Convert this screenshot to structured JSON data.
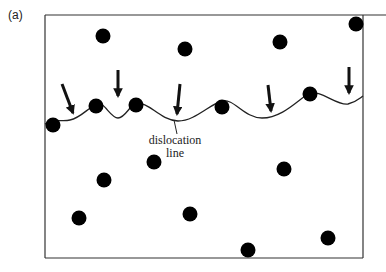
{
  "figure": {
    "panel_label": "(a)",
    "annotation": {
      "line1": "dislocation",
      "line2": "line"
    },
    "frame": {
      "x": 45,
      "y": 15,
      "width": 318,
      "height": 243,
      "top_edge_extends_to": 386
    },
    "colors": {
      "particle": "#000000",
      "line": "#222222",
      "frame": "#333333"
    },
    "particles": [
      {
        "x": 103,
        "y": 36
      },
      {
        "x": 185,
        "y": 49
      },
      {
        "x": 280,
        "y": 42
      },
      {
        "x": 356,
        "y": 24
      },
      {
        "x": 53,
        "y": 125
      },
      {
        "x": 96,
        "y": 106
      },
      {
        "x": 136,
        "y": 105
      },
      {
        "x": 222,
        "y": 107
      },
      {
        "x": 310,
        "y": 94
      },
      {
        "x": 154,
        "y": 162
      },
      {
        "x": 104,
        "y": 180
      },
      {
        "x": 284,
        "y": 169
      },
      {
        "x": 79,
        "y": 218
      },
      {
        "x": 190,
        "y": 214
      },
      {
        "x": 248,
        "y": 250
      },
      {
        "x": 328,
        "y": 238
      }
    ],
    "arrows": [
      {
        "x1": 62,
        "y1": 84,
        "x2": 73,
        "y2": 113
      },
      {
        "x1": 118,
        "y1": 70,
        "x2": 118,
        "y2": 96
      },
      {
        "x1": 180,
        "y1": 84,
        "x2": 177,
        "y2": 114
      },
      {
        "x1": 268,
        "y1": 85,
        "x2": 271,
        "y2": 111
      },
      {
        "x1": 349,
        "y1": 67,
        "x2": 349,
        "y2": 93
      }
    ]
  }
}
